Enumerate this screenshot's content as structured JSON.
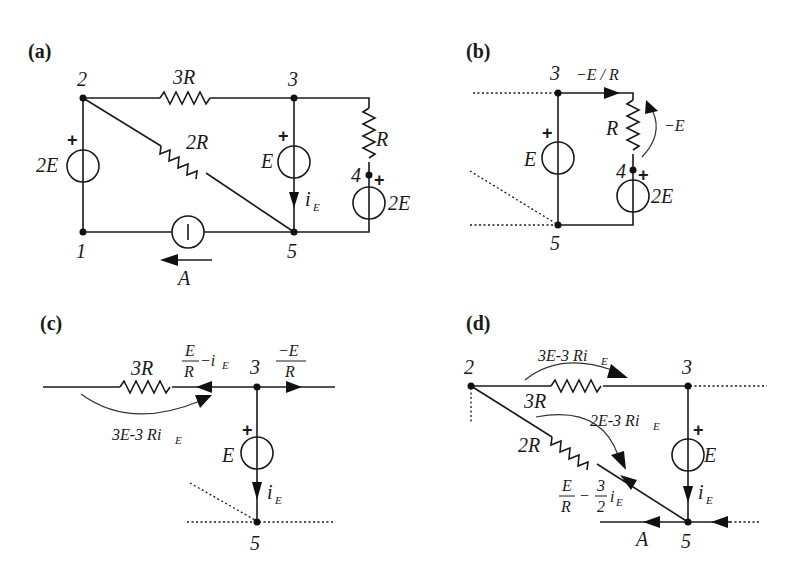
{
  "figure": {
    "panels": [
      {
        "id": "a",
        "label": "(a)",
        "nodes": [
          "1",
          "2",
          "3",
          "4",
          "5"
        ],
        "elements": {
          "r_23": "3R",
          "r_25": "2R",
          "r_34": "R",
          "v_12": "2E",
          "v_35": "E",
          "v_45": "2E",
          "i_15": "A",
          "current_label": "i",
          "current_sub": "E"
        },
        "node_labels": {
          "n1": "1",
          "n2": "2",
          "n3": "3",
          "n4": "4",
          "n5": "5"
        }
      },
      {
        "id": "b",
        "label": "(b)",
        "node_labels": {
          "n3": "3",
          "n4": "4",
          "n5": "5"
        },
        "elements": {
          "v_35": "E",
          "r_34": "R",
          "v_45": "2E",
          "current_34": "−E / R",
          "voltage_R": "−E"
        }
      },
      {
        "id": "c",
        "label": "(c)",
        "node_labels": {
          "n3": "3",
          "n5": "5"
        },
        "elements": {
          "r": "3R",
          "v_35": "E",
          "current_left_num": "E",
          "current_left_den": "R",
          "current_left_rest": "−i",
          "current_left_sub": "E",
          "current_right_num": "−E",
          "current_right_den": "R",
          "voltage_3R": "3E-3 Ri",
          "voltage_3R_sub": "E",
          "current_label": "i",
          "current_sub": "E"
        }
      },
      {
        "id": "d",
        "label": "(d)",
        "node_labels": {
          "n2": "2",
          "n3": "3",
          "n5": "5"
        },
        "elements": {
          "r_23": "3R",
          "r_25": "2R",
          "v_35": "E",
          "voltage_3R": "3E-3 Ri",
          "voltage_3R_sub": "E",
          "voltage_2R": "2E-3 Ri",
          "voltage_2R_sub": "E",
          "current_2R_num1": "E",
          "current_2R_den1": "R",
          "current_2R_minus": "−",
          "current_2R_num2": "3",
          "current_2R_den2": "2",
          "current_2R_var": "i",
          "current_2R_sub": "E",
          "current_label": "i",
          "current_sub": "E",
          "source_current": "A"
        }
      }
    ],
    "plus_sign": "+"
  }
}
